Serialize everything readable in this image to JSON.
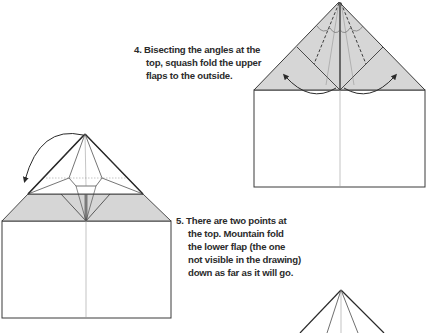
{
  "colors": {
    "shade": "#d6d6d6",
    "line": "#3a3a3a",
    "thin_line": "#8a8a8a",
    "text": "#2b2b2b",
    "background": "#ffffff"
  },
  "steps": [
    {
      "number": "4.",
      "lines": [
        "4. Bisecting the angles at the",
        "top, squash fold the upper",
        "flaps to the outside."
      ]
    },
    {
      "number": "5.",
      "lines": [
        "5. There are two points at",
        "the top. Mountain fold",
        "the lower flap (the one",
        "not visible in the drawing)",
        "down as far as it will go."
      ]
    }
  ],
  "diagrams": [
    {
      "id": "step-4-diagram",
      "description": "House shape with shaded triangular roof, dashed bisecting valley lines, two curved arrows pointing outward"
    },
    {
      "id": "step-5-diagram",
      "description": "Squash-folded model with shaded band, curved arrow at top-left indicating mountain fold"
    },
    {
      "id": "step-6-diagram",
      "description": "Partial view of next step's pointed top"
    }
  ]
}
